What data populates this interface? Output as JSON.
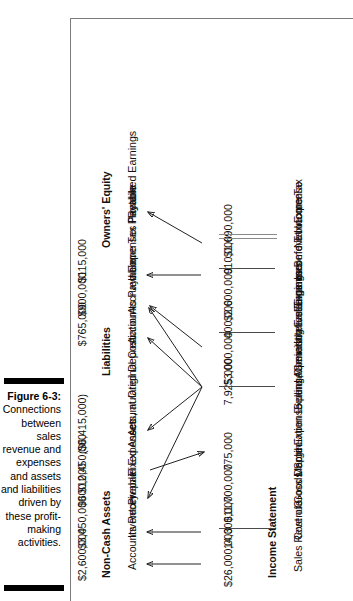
{
  "caption": {
    "figure_number": "Figure 6-3:",
    "text": "Connections between sales revenue and expenses and assets and liabilities driven by these profit-making activities."
  },
  "income_statement": {
    "heading": "Income Statement",
    "rows": [
      {
        "label": "Sales Revenue",
        "value": "$26,000,000",
        "rule": "none"
      },
      {
        "label": "Cost of Goods Sold Expense",
        "value": "14,300,000",
        "rule": "single"
      },
      {
        "label": "Gross Margin",
        "value": "$11,700,000",
        "rule": "none"
      },
      {
        "label": "Depreciation Expense",
        "value": "775,000",
        "rule": "none"
      },
      {
        "label": "Selling, General and Administrative Expenses",
        "value": "7,925,000",
        "rule": "single"
      },
      {
        "label": "Operating Earnings",
        "value": "$3,000,000",
        "rule": "none"
      },
      {
        "label": "Interest Expense",
        "value": "400,000",
        "rule": "single"
      },
      {
        "label": "Earnings Before Income Tax",
        "value": "$2,600,000",
        "rule": "none"
      },
      {
        "label": "Income Tax Expense",
        "value": "910,000",
        "rule": "single"
      },
      {
        "label": "Net Income",
        "value": "$1,690,000",
        "rule": "double"
      }
    ]
  },
  "balance_sheet": {
    "sections": [
      {
        "heading": "Non-Cash Assets",
        "rows": [
          {
            "label": "Accounts Receivable",
            "value": "$2,600,000"
          },
          {
            "label": "Inventory",
            "value": "$3,450,000"
          },
          {
            "label": "Prepaid Expenses",
            "value": "$600,000"
          },
          {
            "label": "Fixed Assets, at Original Cost",
            "value": "$12,450,000"
          },
          {
            "label": "Accumulated Depreciation",
            "value": "($6,415,000)"
          }
        ]
      },
      {
        "heading": "Liabilities",
        "rows": [
          {
            "label": "Accounts Payable",
            "value": "$765,000"
          },
          {
            "label": "Accrued Expenses Payable",
            "value": "$900,000"
          },
          {
            "label": "Income Tax Payable",
            "value": "$115,000"
          }
        ]
      },
      {
        "heading": "Owners' Equity",
        "rows": [
          {
            "label": "Retained Earnings",
            "value": ""
          }
        ]
      }
    ]
  },
  "colors": {
    "rule": "#4a4a4a",
    "arrow": "#222222",
    "frame": "#7c7c7c",
    "caption_bar": "#000000"
  }
}
